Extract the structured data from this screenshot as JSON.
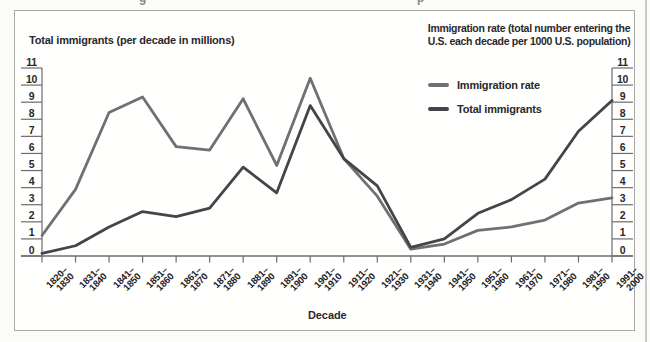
{
  "page": {
    "background": "#fbfbf8"
  },
  "frame": {
    "border_color": "#a9a9a9",
    "background": "#fffffe"
  },
  "artifacts": {
    "frag1": "g",
    "frag2": "p"
  },
  "chart_data": {
    "type": "line",
    "title_left": "Total immigrants (per decade in millions)",
    "title_right_lines": [
      "Immigration rate (total number entering the",
      "U.S. each decade per 1000 U.S. population)"
    ],
    "xlabel": "Decade",
    "categories": [
      "1820–1830",
      "1831–1840",
      "1841–1850",
      "1851–1860",
      "1861–1870",
      "1871–1880",
      "1881–1890",
      "1891–1900",
      "1901–1910",
      "1911–1920",
      "1921–1930",
      "1931–1940",
      "1941–1950",
      "1951–1960",
      "1961–1970",
      "1971–1980",
      "1981–1990",
      "1991–2000"
    ],
    "ylim": [
      0,
      11
    ],
    "ytick_step": 1,
    "grid": false,
    "legend_position": "top-center",
    "axis_color": "#6c6b6f",
    "tick_label_color": "#29282c",
    "series": [
      {
        "name": "Immigration rate",
        "color": "#716f73",
        "values": [
          1.2,
          3.9,
          8.4,
          9.3,
          6.4,
          6.2,
          9.2,
          5.3,
          10.4,
          5.7,
          3.5,
          0.4,
          0.7,
          1.5,
          1.7,
          2.1,
          3.1,
          3.4
        ]
      },
      {
        "name": "Total immigrants",
        "color": "#454449",
        "values": [
          0.15,
          0.6,
          1.7,
          2.6,
          2.3,
          2.8,
          5.2,
          3.7,
          8.8,
          5.7,
          4.1,
          0.5,
          1.0,
          2.5,
          3.3,
          4.5,
          7.3,
          9.1
        ]
      }
    ]
  }
}
